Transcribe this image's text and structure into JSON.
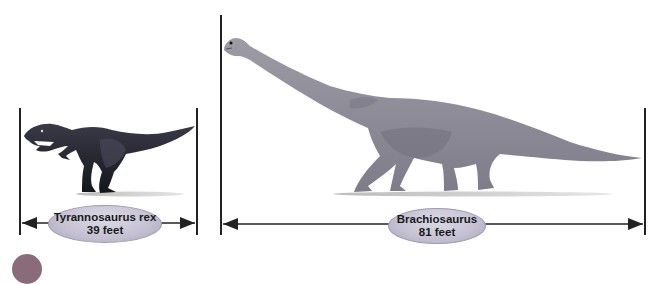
{
  "figure": {
    "dinosaurs": [
      {
        "name": "Tyrannosaurus rex",
        "length": "39 feet",
        "color": "#2a2a33"
      },
      {
        "name": "Brachiosaurus",
        "length": "81 feet",
        "color": "#8d8c98"
      }
    ]
  },
  "colors": {
    "line": "#222222",
    "ellipse_fill": "#c4c0d2",
    "ground_shadow": "#c8c8c8",
    "corner_marker": "#8a6b7a"
  }
}
